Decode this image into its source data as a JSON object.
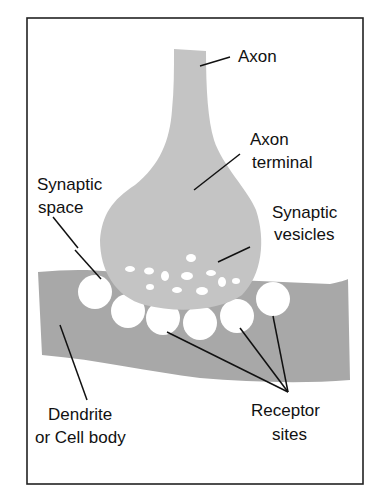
{
  "figure": {
    "colors": {
      "frame": "#222222",
      "axon_fill": "#c4c4c4",
      "dendrite_fill": "#a8a8a8",
      "vesicle_fill": "#ffffff",
      "line": "#111111"
    },
    "labels": {
      "axon": "Axon",
      "axon_terminal_line1": "Axon",
      "axon_terminal_line2": "terminal",
      "synaptic_space_line1": "Synaptic",
      "synaptic_space_line2": "space",
      "synaptic_vesicles_line1": "Synaptic",
      "synaptic_vesicles_line2": "vesicles",
      "dendrite_line1": "Dendrite",
      "dendrite_line2": "or Cell body",
      "receptor_line1": "Receptor",
      "receptor_line2": "sites"
    }
  }
}
